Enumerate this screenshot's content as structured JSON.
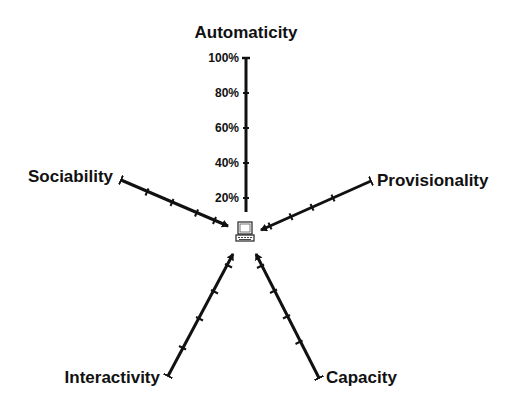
{
  "diagram": {
    "type": "radial-axes",
    "center_icon": "computer-icon",
    "axes": [
      {
        "label": "Automaticity",
        "ticks": [
          "20%",
          "40%",
          "60%",
          "80%",
          "100%"
        ]
      },
      {
        "label": "Provisionality"
      },
      {
        "label": "Capacity"
      },
      {
        "label": "Interactivity"
      },
      {
        "label": "Sociability"
      }
    ]
  }
}
